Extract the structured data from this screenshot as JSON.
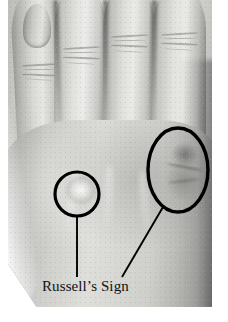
{
  "figure": {
    "caption_text": "Russell’s Sign",
    "background_color": "#ffffff",
    "annotation_color": "#000000",
    "caption_color": "#111111"
  },
  "photo": {
    "description": "Black and white photograph of the back of a left hand with four fingers extended",
    "tone_light": "#e6e6e3",
    "tone_mid": "#c8c8c5",
    "tone_dark": "#7e7e7c"
  },
  "anatomy": {
    "fingers": [
      {
        "name": "index-finger"
      },
      {
        "name": "middle-finger"
      },
      {
        "name": "ring-finger"
      },
      {
        "name": "little-finger"
      }
    ],
    "features": [
      {
        "name": "fingernail"
      },
      {
        "name": "knuckle-callus-left"
      },
      {
        "name": "knuckle-callus-right"
      }
    ]
  },
  "annotations": {
    "markers": [
      {
        "name": "circle-marker-left",
        "shape": "circle",
        "cx": 77,
        "cy": 194,
        "r": 22,
        "stroke": "#000000",
        "stroke_width": 3.2
      },
      {
        "name": "ellipse-marker-right",
        "shape": "ellipse",
        "cx": 178,
        "cy": 170,
        "rx": 30,
        "ry": 42,
        "stroke": "#000000",
        "stroke_width": 3.4
      }
    ],
    "leader_lines": [
      {
        "name": "leader-line-left",
        "x1": 77,
        "y1": 216,
        "x2": 77,
        "y2": 277,
        "stroke": "#000000",
        "stroke_width": 1.9
      },
      {
        "name": "leader-line-right",
        "x1": 163,
        "y1": 207,
        "x2": 122,
        "y2": 277,
        "stroke": "#000000",
        "stroke_width": 1.9
      }
    ]
  }
}
